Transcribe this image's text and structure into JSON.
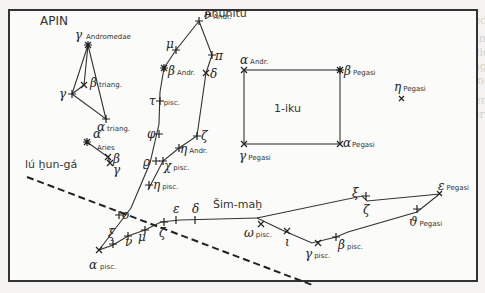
{
  "title": "APIN",
  "background_text": [
    "XVIII. Pegasus und Andromeda",
    "Die Serie MUL.APIN stellt Anunītu zusammen mit den Fischen dar.",
    "konstellationen. Wir sehen die Gestirne der Fische und",
    "über die damalige Anordnung der Sternbilder im",
    "MUL.APIN. Es erscheinen Andromeda und",
    "Wir zugrunde gelegt, die Sterne",
    "auch lernen sich und die Sterne",
    "zusammengesetzt werden",
    "T. T. Bezeichnung von XXX"
  ],
  "constellations": {
    "anunitu": "Anunītu",
    "iku": "1-iku",
    "simmah": "Šim-maḫ",
    "hunga": "lú ḫun-gá"
  },
  "stars": [
    {
      "greek": "γ",
      "sub": "Andromedae"
    },
    {
      "greek": "β",
      "sub": "triang."
    },
    {
      "greek": "γ",
      "sub": ""
    },
    {
      "greek": "α",
      "sub": "triang."
    },
    {
      "greek": "α",
      "sub": ""
    },
    {
      "greek": "Aries",
      "sub": ""
    },
    {
      "greek": "β",
      "sub": ""
    },
    {
      "greek": "γ",
      "sub": ""
    },
    {
      "greek": "ν",
      "sub": "Andr."
    },
    {
      "greek": "μ",
      "sub": ""
    },
    {
      "greek": "β",
      "sub": "Andr."
    },
    {
      "greek": "π",
      "sub": ""
    },
    {
      "greek": "δ",
      "sub": ""
    },
    {
      "greek": "τ",
      "sub": "pisc."
    },
    {
      "greek": "φ",
      "sub": ""
    },
    {
      "greek": "ζ",
      "sub": ""
    },
    {
      "greek": "η",
      "sub": "Andr."
    },
    {
      "greek": "ϱ",
      "sub": ""
    },
    {
      "greek": "χ",
      "sub": "pisc."
    },
    {
      "greek": "η",
      "sub": "pisc."
    },
    {
      "greek": "ο",
      "sub": ""
    },
    {
      "greek": "ξ",
      "sub": ""
    },
    {
      "greek": "ν",
      "sub": ""
    },
    {
      "greek": "μ",
      "sub": ""
    },
    {
      "greek": "ζ",
      "sub": ""
    },
    {
      "greek": "α",
      "sub": "pisc."
    },
    {
      "greek": "ε",
      "sub": ""
    },
    {
      "greek": "δ",
      "sub": ""
    },
    {
      "greek": "ω",
      "sub": "pisc."
    },
    {
      "greek": "ι",
      "sub": ""
    },
    {
      "greek": "γ",
      "sub": "pisc."
    },
    {
      "greek": "β",
      "sub": "pisc."
    },
    {
      "greek": "α",
      "sub": "Andr."
    },
    {
      "greek": "β",
      "sub": "Pegasi"
    },
    {
      "greek": "γ",
      "sub": "Pegasi"
    },
    {
      "greek": "α",
      "sub": "Pegasi"
    },
    {
      "greek": "η",
      "sub": "Pegasi"
    },
    {
      "greek": "ξ",
      "sub": ""
    },
    {
      "greek": "ζ",
      "sub": ""
    },
    {
      "greek": "ε",
      "sub": "Pegasi"
    },
    {
      "greek": "ϑ",
      "sub": "Pegasi"
    }
  ]
}
